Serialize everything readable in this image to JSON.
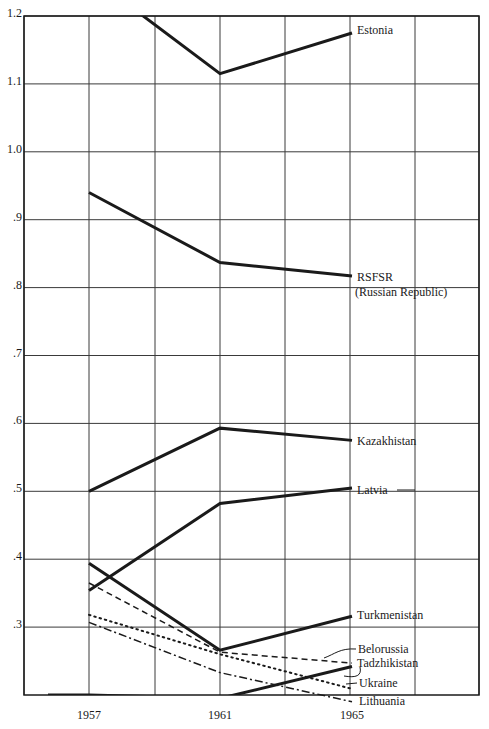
{
  "chart_data": {
    "type": "line",
    "title": "",
    "xlabel": "",
    "ylabel": "",
    "x": [
      1957,
      1961,
      1965
    ],
    "x_tick_labels": [
      "1957",
      "1961",
      "1965"
    ],
    "y_tick_labels": [
      "1.2",
      "1.1",
      "1.0",
      ".9",
      ".8",
      ".7",
      ".6",
      ".5",
      ".4",
      ".3"
    ],
    "y_ticks": [
      1.2,
      1.1,
      1.0,
      0.9,
      0.8,
      0.7,
      0.6,
      0.5,
      0.4,
      0.3
    ],
    "ylim": [
      0.2,
      1.2
    ],
    "grid": true,
    "legend_position": "inline labels at right end of each line",
    "series": [
      {
        "name": "Estonia",
        "values": [
          1.26,
          1.115,
          1.175
        ],
        "style": "solid-thick"
      },
      {
        "name": "RSFSR (Russian Republic)",
        "values": [
          0.94,
          0.837,
          0.817
        ],
        "style": "solid-thick"
      },
      {
        "name": "Kazakhistan",
        "values": [
          0.5,
          0.593,
          0.575
        ],
        "style": "solid-thick"
      },
      {
        "name": "Latvia",
        "values": [
          0.354,
          0.482,
          0.505
        ],
        "style": "solid-thick"
      },
      {
        "name": "Turkmenistan",
        "values": [
          0.394,
          0.266,
          0.316
        ],
        "style": "solid-thick"
      },
      {
        "name": "Belorussia",
        "values": [
          0.365,
          0.263,
          0.247
        ],
        "style": "dashed"
      },
      {
        "name": "Tadzhikistan",
        "values": [
          0.2,
          0.195,
          0.242
        ],
        "style": "solid-thick"
      },
      {
        "name": "Ukraine",
        "values": [
          0.318,
          0.26,
          0.209
        ],
        "style": "dotted"
      },
      {
        "name": "Lithuania",
        "values": [
          0.307,
          0.233,
          0.19
        ],
        "style": "dash-dot"
      }
    ]
  },
  "labels": {
    "estonia": "Estonia",
    "rsfsr_1": "RSFSR",
    "rsfsr_2": "(Russian Republic)",
    "kazakhistan": "Kazakhistan",
    "latvia": "Latvia",
    "turkmenistan": "Turkmenistan",
    "belorussia": "Belorussia",
    "tadzhikistan": "Tadzhikistan",
    "ukraine": "Ukraine",
    "lithuania": "Lithuania"
  },
  "colors": {
    "line": "#1a1a1a",
    "grid": "#3a3a3a",
    "background": "#ffffff"
  }
}
